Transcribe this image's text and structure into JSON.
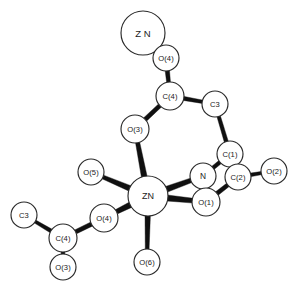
{
  "figure": {
    "kind": "ortep-molecular-structure-diagram",
    "background_color": "#ffffff",
    "bond_color": "#101010",
    "atom_fill_color": "#ffffff",
    "atom_outline_color": "#2a2a2a",
    "label_color": "#1a1a1a",
    "width": 299,
    "height": 294
  },
  "atoms": [
    {
      "id": "zn-terminal",
      "label": "Z N",
      "element": "Zn",
      "x": 143,
      "y": 33,
      "r": 22,
      "font_size": 9.5
    },
    {
      "id": "o4-top",
      "label": "O(4)",
      "element": "O",
      "x": 166,
      "y": 58,
      "r": 13,
      "font_size": 7.6
    },
    {
      "id": "c4-upper",
      "label": "C(4)",
      "element": "C",
      "x": 170,
      "y": 96,
      "r": 14,
      "font_size": 7.6
    },
    {
      "id": "c3-upper",
      "label": "C3",
      "element": "C",
      "x": 215,
      "y": 104,
      "r": 13,
      "font_size": 7.6
    },
    {
      "id": "o3-middle",
      "label": "O(3)",
      "element": "O",
      "x": 135,
      "y": 129,
      "r": 14,
      "font_size": 7.6
    },
    {
      "id": "c1",
      "label": "C(1)",
      "element": "C",
      "x": 230,
      "y": 154,
      "r": 13,
      "font_size": 7.6
    },
    {
      "id": "n",
      "label": "N",
      "element": "N",
      "x": 203,
      "y": 176,
      "r": 13,
      "font_size": 8.4
    },
    {
      "id": "c2",
      "label": "C(2)",
      "element": "C",
      "x": 238,
      "y": 177,
      "r": 13,
      "font_size": 7.6
    },
    {
      "id": "o2",
      "label": "O(2)",
      "element": "O",
      "x": 274,
      "y": 171,
      "r": 13,
      "font_size": 7.6
    },
    {
      "id": "o1",
      "label": "O(1)",
      "element": "O",
      "x": 206,
      "y": 202,
      "r": 14,
      "font_size": 7.6
    },
    {
      "id": "o5",
      "label": "O(5)",
      "element": "O",
      "x": 91,
      "y": 172,
      "r": 13,
      "font_size": 7.6
    },
    {
      "id": "zn-center",
      "label": "ZN",
      "element": "Zn",
      "x": 148,
      "y": 196,
      "r": 20,
      "font_size": 9.0
    },
    {
      "id": "o4-left",
      "label": "O(4)",
      "element": "O",
      "x": 104,
      "y": 218,
      "r": 14,
      "font_size": 7.6
    },
    {
      "id": "c4-lower",
      "label": "C(4)",
      "element": "C",
      "x": 63,
      "y": 238,
      "r": 14,
      "font_size": 7.6
    },
    {
      "id": "c3-lower",
      "label": "C3",
      "element": "C",
      "x": 24,
      "y": 215,
      "r": 13,
      "font_size": 7.6
    },
    {
      "id": "o3-bottom",
      "label": "O(3)",
      "element": "O",
      "x": 63,
      "y": 267,
      "r": 13,
      "font_size": 7.6
    },
    {
      "id": "o6",
      "label": "O(6)",
      "element": "O",
      "x": 147,
      "y": 262,
      "r": 13,
      "font_size": 7.6
    }
  ],
  "bonds": [
    {
      "id": "bond-zn-terminal-o4-top",
      "from": "zn-terminal",
      "to": "o4-top",
      "w_from": 3.4,
      "w_to": 4.6
    },
    {
      "id": "bond-o4-top-c4-upper",
      "from": "o4-top",
      "to": "c4-upper",
      "w_from": 4.6,
      "w_to": 3.6
    },
    {
      "id": "bond-c4-upper-c3-upper",
      "from": "c4-upper",
      "to": "c3-upper",
      "w_from": 4.2,
      "w_to": 3.2
    },
    {
      "id": "bond-c4-upper-o3-middle",
      "from": "c4-upper",
      "to": "o3-middle",
      "w_from": 4.2,
      "w_to": 4.4
    },
    {
      "id": "bond-c3-upper-c1",
      "from": "c3-upper",
      "to": "c1",
      "w_from": 3.4,
      "w_to": 4.2
    },
    {
      "id": "bond-o3-middle-zn-center",
      "from": "o3-middle",
      "to": "zn-center",
      "w_from": 4.0,
      "w_to": 6.0
    },
    {
      "id": "bond-c1-n",
      "from": "c1",
      "to": "n",
      "w_from": 4.0,
      "w_to": 3.8
    },
    {
      "id": "bond-c1-c2",
      "from": "c1",
      "to": "c2",
      "w_from": 4.0,
      "w_to": 4.0
    },
    {
      "id": "bond-c2-o2",
      "from": "c2",
      "to": "o2",
      "w_from": 3.8,
      "w_to": 3.0
    },
    {
      "id": "bond-c2-o1",
      "from": "c2",
      "to": "o1",
      "w_from": 4.0,
      "w_to": 4.4
    },
    {
      "id": "bond-n-zn-center",
      "from": "n",
      "to": "zn-center",
      "w_from": 4.4,
      "w_to": 6.2
    },
    {
      "id": "bond-o1-zn-center",
      "from": "o1",
      "to": "zn-center",
      "w_from": 4.6,
      "w_to": 6.2
    },
    {
      "id": "bond-o5-zn-center",
      "from": "o5",
      "to": "zn-center",
      "w_from": 3.6,
      "w_to": 6.0
    },
    {
      "id": "bond-o4-left-zn-center",
      "from": "o4-left",
      "to": "zn-center",
      "w_from": 4.4,
      "w_to": 6.0
    },
    {
      "id": "bond-zn-center-o6",
      "from": "zn-center",
      "to": "o6",
      "w_from": 5.6,
      "w_to": 3.6
    },
    {
      "id": "bond-o4-left-c4-lower",
      "from": "o4-left",
      "to": "c4-lower",
      "w_from": 4.4,
      "w_to": 4.2
    },
    {
      "id": "bond-c4-lower-c3-lower",
      "from": "c4-lower",
      "to": "c3-lower",
      "w_from": 4.2,
      "w_to": 3.0
    },
    {
      "id": "bond-c4-lower-o3-bottom",
      "from": "c4-lower",
      "to": "o3-bottom",
      "w_from": 4.0,
      "w_to": 3.4
    }
  ]
}
